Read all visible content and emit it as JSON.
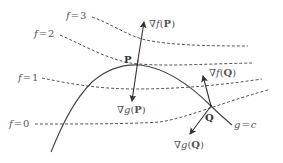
{
  "diagram": {
    "level_curves": [
      {
        "label": "f=3",
        "name": "f",
        "value": "3"
      },
      {
        "label": "f=2",
        "name": "f",
        "value": "2"
      },
      {
        "label": "f=1",
        "name": "f",
        "value": "1"
      },
      {
        "label": "f=0",
        "name": "f",
        "value": "0"
      }
    ],
    "constraint_curve": {
      "label_lhs": "g",
      "label_eq": "=",
      "label_rhs": "c"
    },
    "points": {
      "P": "P",
      "Q": "Q"
    },
    "vectors": {
      "grad_f_P": {
        "nabla": "∇",
        "fn": "f",
        "open": "(",
        "pt": "P",
        "close": ")"
      },
      "grad_g_P": {
        "nabla": "∇",
        "fn": "g",
        "open": "(",
        "pt": "P",
        "close": ")"
      },
      "grad_f_Q": {
        "nabla": "∇",
        "fn": "f",
        "open": "(",
        "pt": "Q",
        "close": ")"
      },
      "grad_g_Q": {
        "nabla": "∇",
        "fn": "g",
        "open": "(",
        "pt": "Q",
        "close": ")"
      }
    },
    "colors": {
      "line": "#444444",
      "text": "#555555",
      "background": "#ffffff"
    }
  }
}
